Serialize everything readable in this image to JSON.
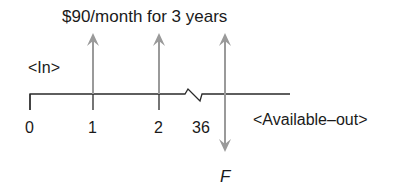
{
  "diagram": {
    "type": "cash-flow-timeline",
    "title": "$90/month for 3 years",
    "inflow_label": "<In>",
    "outflow_label": "<Available–out>",
    "future_value_label": "F",
    "periods": [
      {
        "label": "0",
        "arrow": "none"
      },
      {
        "label": "1",
        "arrow": "up",
        "amount": 90
      },
      {
        "label": "2",
        "arrow": "up",
        "amount": 90
      },
      {
        "label": "36",
        "arrow": "up-and-down",
        "amount": 90,
        "outflow": "F"
      }
    ],
    "axis_break_between": [
      "2",
      "36"
    ],
    "colors": {
      "axis": "#2a2a2a",
      "arrow": "#9a9a9a",
      "text": "#1a1a1a"
    }
  }
}
